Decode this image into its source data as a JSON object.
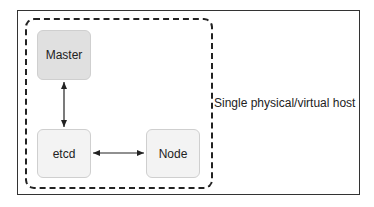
{
  "diagram": {
    "host_label": "Single physical/virtual host",
    "nodes": {
      "master": "Master",
      "etcd": "etcd",
      "node": "Node"
    },
    "edges": [
      {
        "from": "master",
        "to": "etcd",
        "direction": "bidirectional"
      },
      {
        "from": "etcd",
        "to": "node",
        "direction": "bidirectional"
      }
    ],
    "colors": {
      "master_fill": "#e0e0e0",
      "node_fill": "#f3f3f3",
      "stroke": "#222222"
    }
  }
}
